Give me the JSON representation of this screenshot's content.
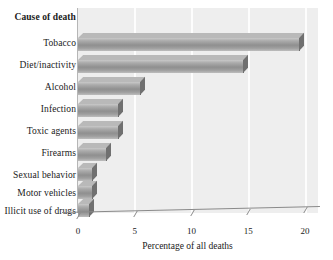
{
  "chart_data": {
    "type": "bar",
    "orientation": "horizontal",
    "title": "",
    "xlabel": "Percentage of all deaths",
    "ylabel": "Cause of death",
    "categories": [
      "Tobacco",
      "Diet/inactivity",
      "Alcohol",
      "Infection",
      "Toxic agents",
      "Firearms",
      "Sexual behavior",
      "Motor vehicles",
      "Illicit use of drugs"
    ],
    "values": [
      19.5,
      14.5,
      5.5,
      3.5,
      3.5,
      2.5,
      1.2,
      1.2,
      1.0
    ],
    "xlim": [
      0,
      20
    ],
    "xticks": [
      0,
      5,
      10,
      15,
      20
    ],
    "xtick_labels": [
      "0",
      "5",
      "10",
      "15",
      "20"
    ],
    "grid": "vertical-white",
    "legend": "none",
    "style": "3d-horizontal-bars",
    "colors": {
      "bar_front_light": "#c9c9c9",
      "bar_front_dark": "#8f8f8f",
      "bar_top": "#b9b9b9",
      "bar_side": "#707070",
      "plot_background": "#eeeeee",
      "gridline": "#fdfdfd",
      "axis": "#8a8a8a",
      "text": "#1a1a1a"
    }
  },
  "axis": {
    "y_header": "Cause of death",
    "x_title": "Percentage of all deaths"
  }
}
